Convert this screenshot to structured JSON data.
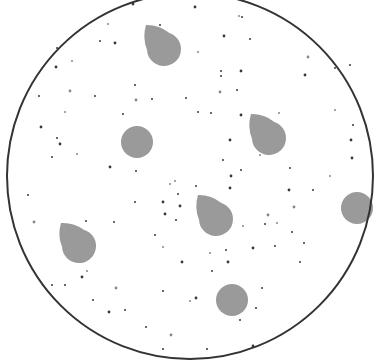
{
  "diagram": {
    "width": 374,
    "height": 361,
    "background": "#ffffff",
    "boundary": {
      "shape": "circle",
      "cx": 190,
      "cy": 176,
      "r": 183,
      "stroke": "#333333",
      "stroke_width": 2
    },
    "shape_fill": "#9a9a9a",
    "dot_fill": "#222222",
    "teardrops": [
      {
        "tip_x": 146,
        "tip_y": 25,
        "cx": 164,
        "cy": 49,
        "r": 17
      },
      {
        "tip_x": 251,
        "tip_y": 114,
        "cx": 269,
        "cy": 138,
        "r": 17
      },
      {
        "tip_x": 198,
        "tip_y": 195,
        "cx": 216,
        "cy": 219,
        "r": 17
      },
      {
        "tip_x": 61,
        "tip_y": 223,
        "cx": 79,
        "cy": 246,
        "r": 17
      }
    ],
    "disks": [
      {
        "cx": 137,
        "cy": 142,
        "r": 16
      },
      {
        "cx": 357,
        "cy": 208,
        "r": 16
      },
      {
        "cx": 232,
        "cy": 300,
        "r": 16
      }
    ],
    "dots": [
      [
        133,
        4
      ],
      [
        108,
        24
      ],
      [
        100,
        41
      ],
      [
        115,
        43
      ],
      [
        57,
        48
      ],
      [
        72,
        61
      ],
      [
        56,
        67
      ],
      [
        135,
        85
      ],
      [
        152,
        99
      ],
      [
        136,
        100
      ],
      [
        186,
        98
      ],
      [
        123,
        114
      ],
      [
        41,
        127
      ],
      [
        65,
        112
      ],
      [
        57,
        138
      ],
      [
        60,
        144
      ],
      [
        52,
        157
      ],
      [
        77,
        154
      ],
      [
        110,
        167
      ],
      [
        136,
        171
      ],
      [
        39,
        96
      ],
      [
        70,
        91
      ],
      [
        95,
        96
      ],
      [
        160,
        25
      ],
      [
        195,
        7
      ],
      [
        239,
        16
      ],
      [
        242,
        17
      ],
      [
        224,
        36
      ],
      [
        250,
        39
      ],
      [
        198,
        52
      ],
      [
        241,
        71
      ],
      [
        221,
        71
      ],
      [
        221,
        76
      ],
      [
        220,
        92
      ],
      [
        237,
        90
      ],
      [
        211,
        113
      ],
      [
        241,
        115
      ],
      [
        279,
        113
      ],
      [
        271,
        133
      ],
      [
        305,
        75
      ],
      [
        335,
        68
      ],
      [
        335,
        110
      ],
      [
        351,
        140
      ],
      [
        353,
        125
      ],
      [
        350,
        65
      ],
      [
        308,
        57
      ],
      [
        198,
        112
      ],
      [
        223,
        160
      ],
      [
        230,
        140
      ],
      [
        260,
        155
      ],
      [
        241,
        170
      ],
      [
        231,
        176
      ],
      [
        290,
        168
      ],
      [
        330,
        176
      ],
      [
        352,
        158
      ],
      [
        349,
        196
      ],
      [
        28,
        195
      ],
      [
        34,
        222
      ],
      [
        114,
        222
      ],
      [
        86,
        221
      ],
      [
        180,
        206
      ],
      [
        170,
        184
      ],
      [
        178,
        194
      ],
      [
        165,
        214
      ],
      [
        155,
        235
      ],
      [
        87,
        271
      ],
      [
        82,
        277
      ],
      [
        52,
        285
      ],
      [
        65,
        285
      ],
      [
        116,
        288
      ],
      [
        93,
        300
      ],
      [
        125,
        310
      ],
      [
        109,
        312
      ],
      [
        175,
        181
      ],
      [
        135,
        202
      ],
      [
        163,
        202
      ],
      [
        176,
        220
      ],
      [
        163,
        247
      ],
      [
        182,
        262
      ],
      [
        163,
        291
      ],
      [
        146,
        327
      ],
      [
        171,
        335
      ],
      [
        163,
        349
      ],
      [
        196,
        186
      ],
      [
        230,
        188
      ],
      [
        243,
        226
      ],
      [
        226,
        250
      ],
      [
        253,
        248
      ],
      [
        265,
        224
      ],
      [
        277,
        223
      ],
      [
        289,
        190
      ],
      [
        292,
        232
      ],
      [
        300,
        262
      ],
      [
        294,
        207
      ],
      [
        275,
        246
      ],
      [
        256,
        308
      ],
      [
        196,
        298
      ],
      [
        190,
        301
      ],
      [
        240,
        320
      ],
      [
        253,
        346
      ],
      [
        207,
        349
      ],
      [
        210,
        253
      ],
      [
        228,
        262
      ],
      [
        212,
        271
      ],
      [
        262,
        288
      ],
      [
        268,
        215
      ],
      [
        313,
        190
      ],
      [
        304,
        243
      ]
    ]
  }
}
